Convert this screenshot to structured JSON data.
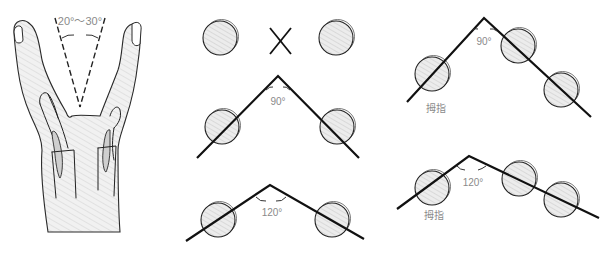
{
  "figure": {
    "hand": {
      "angle_label": "20°～30°"
    },
    "panels": [
      {
        "id": "parallel-no",
        "symbol": "✕"
      },
      {
        "id": "angle-90-two",
        "angle_label": "90°"
      },
      {
        "id": "angle-120-two",
        "angle_label": "120°"
      },
      {
        "id": "angle-90-thumb",
        "angle_label": "90°",
        "thumb_label": "拇指"
      },
      {
        "id": "angle-120-thumb",
        "angle_label": "120°",
        "thumb_label": "拇指"
      }
    ]
  },
  "colors": {
    "line": "#111111",
    "circle_fill": "#e6e6e6",
    "hatch": "#cfcfcf",
    "label": "#8a8a8a",
    "hand_fill": "#ececec"
  }
}
